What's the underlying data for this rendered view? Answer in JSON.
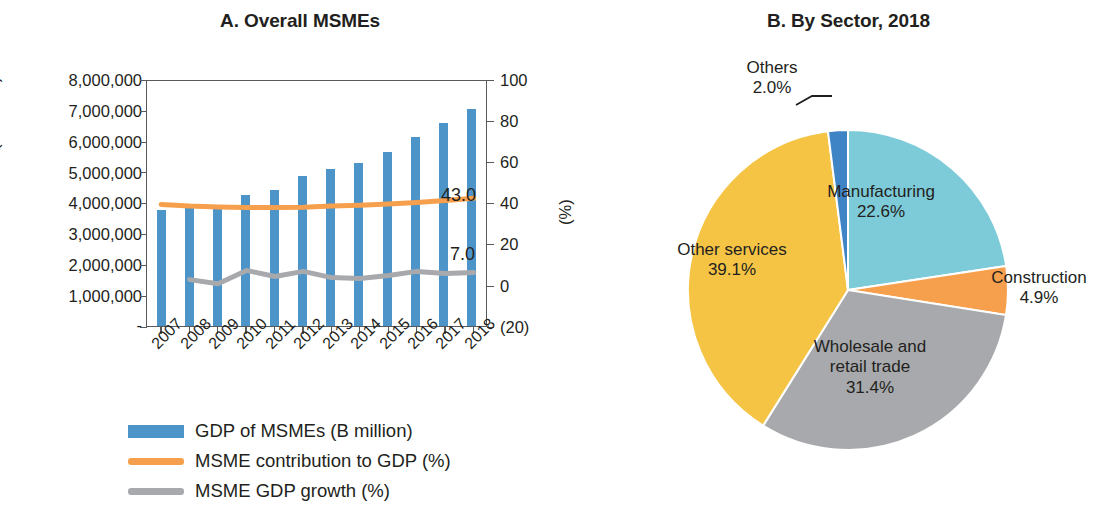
{
  "panel_a": {
    "title": "A. Overall MSMEs",
    "y_left_title": "(B million)",
    "y_right_title": "(%)",
    "y_left_ticks": [
      "8,000,000",
      "7,000,000",
      "6,000,000",
      "5,000,000",
      "4,000,000",
      "3,000,000",
      "2,000,000",
      "1,000,000",
      "-"
    ],
    "y_right_ticks": [
      "100",
      "80",
      "60",
      "40",
      "20",
      "0",
      "(20)"
    ],
    "end_label_contribution": "43.0",
    "end_label_growth": "7.0",
    "legend": [
      {
        "label": "GDP of MSMEs (B million)",
        "color": "#4d94c8",
        "type": "bar"
      },
      {
        "label": "MSME contribution to GDP (%)",
        "color": "#f6a04d",
        "type": "line"
      },
      {
        "label": "MSME GDP growth (%)",
        "color": "#a7a9ac",
        "type": "line"
      }
    ]
  },
  "panel_b": {
    "title": "B. By Sector, 2018",
    "labels": [
      {
        "name": "Manufacturing",
        "value": "22.6%"
      },
      {
        "name": "Construction",
        "value": "4.9%"
      },
      {
        "name": "Wholesale and\nretail trade",
        "value": "31.4%"
      },
      {
        "name": "Other services",
        "value": "39.1%"
      },
      {
        "name": "Others",
        "value": "2.0%"
      }
    ]
  },
  "chart_data": [
    {
      "type": "bar",
      "title": "A. Overall MSMEs",
      "xlabel": "",
      "ylabel": "(B million)",
      "y2label": "(%)",
      "categories": [
        "2007",
        "2008",
        "2009",
        "2010",
        "2011",
        "2012",
        "2013",
        "2014",
        "2015",
        "2016",
        "2017",
        "2018"
      ],
      "ylim": [
        0,
        8000000
      ],
      "y2lim": [
        -20,
        100
      ],
      "grid": false,
      "legend_position": "bottom-left",
      "series": [
        {
          "name": "GDP of MSMEs (B million)",
          "type": "bar",
          "axis": "left",
          "color": "#4d94c8",
          "values": [
            3750000,
            3870000,
            3870000,
            4230000,
            4400000,
            4850000,
            5070000,
            5270000,
            5630000,
            6120000,
            6560000,
            7030000
          ]
        },
        {
          "name": "MSME contribution to GDP (%)",
          "type": "line",
          "axis": "right",
          "color": "#f6a04d",
          "values": [
            40.0,
            39.2,
            38.8,
            38.6,
            38.6,
            38.7,
            39.2,
            39.6,
            40.2,
            41.0,
            42.0,
            43.0
          ],
          "end_label": "43.0"
        },
        {
          "name": "MSME GDP growth (%)",
          "type": "line",
          "axis": "right",
          "color": "#a7a9ac",
          "values": [
            null,
            3.5,
            1.5,
            8.0,
            5.0,
            7.5,
            4.5,
            4.0,
            5.5,
            7.5,
            6.5,
            7.0
          ],
          "end_label": "7.0"
        }
      ]
    },
    {
      "type": "pie",
      "title": "B. By Sector, 2018",
      "labels": [
        "Manufacturing",
        "Construction",
        "Wholesale and retail trade",
        "Other services",
        "Others"
      ],
      "values": [
        22.6,
        4.9,
        31.4,
        39.1,
        2.0
      ],
      "value_labels": [
        "22.6%",
        "4.9%",
        "31.4%",
        "39.1%",
        "2.0%"
      ],
      "colors": [
        "#7dcbd9",
        "#f6a04d",
        "#a7a9ac",
        "#f5c445",
        "#3f85c6"
      ],
      "start_angle_deg": 0,
      "direction": "clockwise",
      "legend_position": "none"
    }
  ]
}
